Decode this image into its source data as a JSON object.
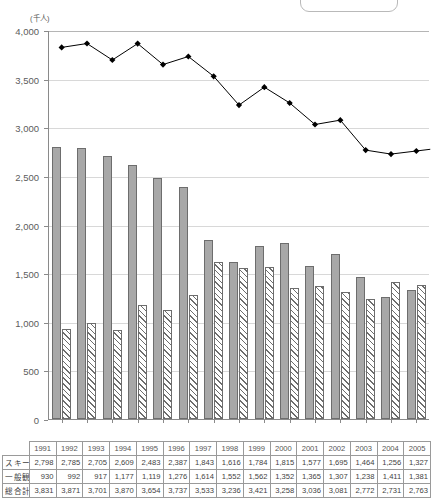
{
  "chart_data": {
    "type": "bar",
    "title": "",
    "xlabel": "",
    "ylabel": "(千人)",
    "unit_label": "(千人)",
    "ylim": [
      0,
      4000
    ],
    "ytick_values": [
      0,
      500,
      1000,
      1500,
      2000,
      2500,
      3000,
      3500,
      4000
    ],
    "ytick_labels": [
      "0",
      "500",
      "1,000",
      "1,500",
      "2,000",
      "2,500",
      "3,000",
      "3,500",
      "4,000"
    ],
    "grid": true,
    "legend_position": "top-right",
    "categories": [
      "1991",
      "1992",
      "1993",
      "1994",
      "1995",
      "1996",
      "1997",
      "1998",
      "1999",
      "2000",
      "2001",
      "2002",
      "2003",
      "2004",
      "2005"
    ],
    "series": [
      {
        "name": "スキー",
        "type": "bar",
        "style": "solid-gray",
        "color": "#a8a8a8",
        "values": [
          2798,
          2785,
          2705,
          2609,
          2483,
          2387,
          1843,
          1616,
          1784,
          1815,
          1577,
          1695,
          1464,
          1256,
          1327
        ]
      },
      {
        "name": "一般観光",
        "type": "bar",
        "style": "hatched",
        "color": "#ffffff",
        "values": [
          930,
          992,
          917,
          1177,
          1119,
          1276,
          1614,
          1552,
          1562,
          1352,
          1365,
          1307,
          1238,
          1411,
          1381
        ]
      },
      {
        "name": "総合計",
        "type": "line",
        "style": "diamond-marker",
        "color": "#000000",
        "values": [
          3831,
          3871,
          3701,
          3870,
          3654,
          3737,
          3533,
          3236,
          3421,
          3258,
          3036,
          3081,
          2772,
          2731,
          2763
        ]
      }
    ]
  },
  "table": {
    "corner_label": "",
    "header": [
      "1991",
      "1992",
      "1993",
      "1994",
      "1995",
      "1996",
      "1997",
      "1998",
      "1999",
      "2000",
      "2001",
      "2002",
      "2003",
      "2004",
      "2005"
    ],
    "rows": [
      {
        "label": "スキー",
        "values": [
          "2,798",
          "2,785",
          "2,705",
          "2,609",
          "2,483",
          "2,387",
          "1,843",
          "1,616",
          "1,784",
          "1,815",
          "1,577",
          "1,695",
          "1,464",
          "1,256",
          "1,327"
        ]
      },
      {
        "label": "一般観光",
        "values": [
          "930",
          "992",
          "917",
          "1,177",
          "1,119",
          "1,276",
          "1,614",
          "1,552",
          "1,562",
          "1,352",
          "1,365",
          "1,307",
          "1,238",
          "1,411",
          "1,381"
        ]
      },
      {
        "label": "総合計",
        "values": [
          "3,831",
          "3,871",
          "3,701",
          "3,870",
          "3,654",
          "3,737",
          "3,533",
          "3,236",
          "3,421",
          "3,258",
          "3,036",
          "3,081",
          "2,772",
          "2,731",
          "2,763"
        ]
      }
    ]
  }
}
